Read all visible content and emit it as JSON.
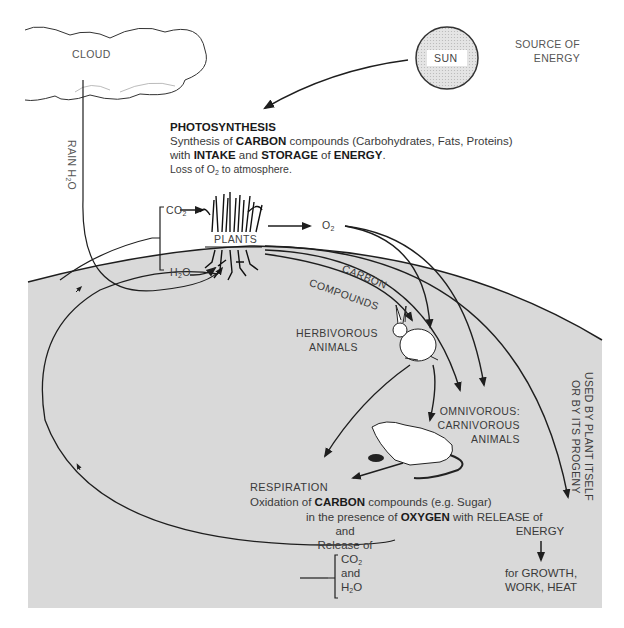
{
  "nodes": {
    "cloud": {
      "label": "CLOUD"
    },
    "sun": {
      "label": "SUN",
      "note_line1": "SOURCE OF",
      "note_line2": "ENERGY"
    },
    "rain": {
      "label_prefix": "RAIN H",
      "label_sub": "2",
      "label_suffix": "O"
    },
    "plants": {
      "label": "PLANTS"
    },
    "co2_in": {
      "prefix": "CO",
      "sub": "2"
    },
    "h2o_in": {
      "prefix": "H",
      "sub": "2",
      "suffix": "O"
    },
    "o2_out": {
      "prefix": "O",
      "sub": "2"
    },
    "carbon_compounds": {
      "line1": "CARBON",
      "line2": "COMPOUNDS"
    },
    "herbivores": {
      "line1": "HERBIVOROUS",
      "line2": "ANIMALS"
    },
    "omnivores": {
      "line1": "OMNIVOROUS:",
      "line2": "CARNIVOROUS",
      "line3": "ANIMALS"
    },
    "plant_use": {
      "line1": "USED BY PLANT ITSELF",
      "line2": "OR BY ITS PROGENY"
    }
  },
  "photosynthesis": {
    "heading": "PHOTOSYNTHESIS",
    "line1": {
      "a": "Synthesis of ",
      "b": "CARBON",
      "c": " compounds (Carbohydrates, Fats, Proteins)"
    },
    "line2": {
      "a": "with ",
      "b": "INTAKE",
      "c": " and ",
      "d": "STORAGE",
      "e": " of ",
      "f": "ENERGY",
      "g": "."
    },
    "line3": {
      "a": "Loss of O",
      "sub": "2",
      "b": " to atmosphere."
    }
  },
  "respiration": {
    "heading": "RESPIRATION",
    "line1": {
      "a": "Oxidation of ",
      "b": "CARBON",
      "c": " compounds (e.g. Sugar)"
    },
    "line2": {
      "a": "in the presence of ",
      "b": "OXYGEN",
      "c": " with RELEASE of"
    },
    "energy": "ENERGY",
    "and1": "and",
    "release_of": "Release of",
    "co2": {
      "prefix": "CO",
      "sub": "2"
    },
    "and2": "and",
    "h2o": {
      "prefix": "H",
      "sub": "2",
      "suffix": "O"
    },
    "uses_line1": "for GROWTH,",
    "uses_line2": "WORK, HEAT"
  },
  "colors": {
    "ground": "#d9d9d9",
    "line": "#1e1e1e",
    "sun_fill": "#dcdcdc",
    "text": "#333333"
  }
}
